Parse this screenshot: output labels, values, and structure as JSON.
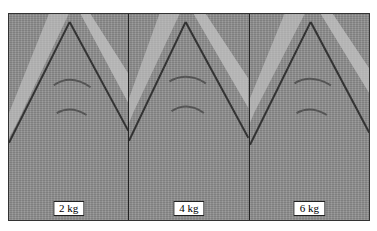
{
  "figure": {
    "panels": [
      {
        "label": "2 kg"
      },
      {
        "label": "4 kg"
      },
      {
        "label": "6 kg"
      }
    ]
  }
}
